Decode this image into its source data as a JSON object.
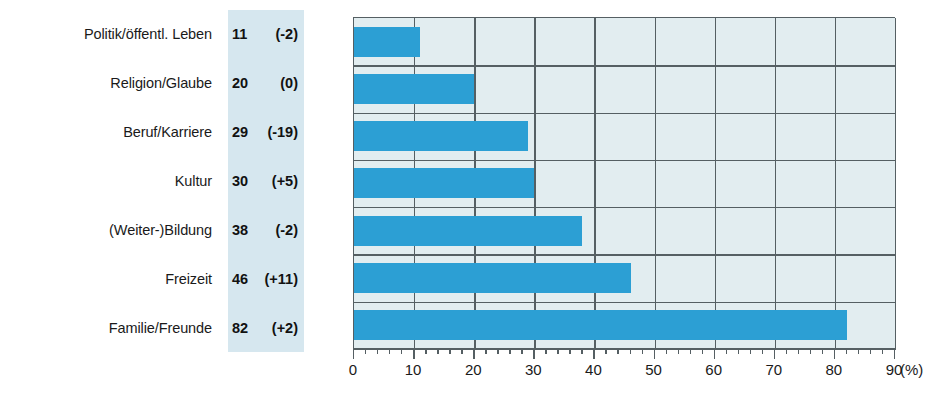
{
  "chart_data": {
    "type": "bar",
    "orientation": "horizontal",
    "title": "",
    "xlabel": "(%)",
    "ylabel": "",
    "xlim": [
      0,
      90
    ],
    "xticks": [
      0,
      10,
      20,
      30,
      40,
      50,
      60,
      70,
      80,
      90
    ],
    "xtick_labels": [
      "0",
      "10",
      "20",
      "30",
      "40",
      "50",
      "60",
      "70",
      "80",
      "90"
    ],
    "minor_tick_step": 2,
    "grid": true,
    "legend": "none",
    "categories": [
      "Politik/öffentl. Leben",
      "Religion/Glaube",
      "Beruf/Karriere",
      "Kultur",
      "(Weiter-)Bildung",
      "Freizeit",
      "Familie/Freunde"
    ],
    "values": [
      11,
      20,
      29,
      30,
      38,
      46,
      82
    ],
    "deltas": [
      "(-2)",
      "(0)",
      "(-19)",
      "(+5)",
      "(-2)",
      "(+11)",
      "(+2)"
    ],
    "delta_values": [
      -2,
      0,
      -19,
      5,
      -2,
      11,
      2
    ],
    "rows": [
      {
        "label": "Politik/öffentl. Leben",
        "value": 11,
        "value_text": "11",
        "delta_text": "(-2)"
      },
      {
        "label": "Religion/Glaube",
        "value": 20,
        "value_text": "20",
        "delta_text": "(0)"
      },
      {
        "label": "Beruf/Karriere",
        "value": 29,
        "value_text": "29",
        "delta_text": "(-19)"
      },
      {
        "label": "Kultur",
        "value": 30,
        "value_text": "30",
        "delta_text": "(+5)"
      },
      {
        "label": "(Weiter-)Bildung",
        "value": 38,
        "value_text": "38",
        "delta_text": "(-2)"
      },
      {
        "label": "Freizeit",
        "value": 46,
        "value_text": "46",
        "delta_text": "(+11)"
      },
      {
        "label": "Familie/Freunde",
        "value": 82,
        "value_text": "82",
        "delta_text": "(+2)"
      }
    ],
    "unit_text": "(%)"
  },
  "colors": {
    "bar": "#2c9fd4",
    "plot_background": "#e2edf0",
    "value_band_background": "#d6e7ef",
    "grid": "#555f63",
    "text": "#1a1a1a",
    "page_background": "#ffffff"
  },
  "footer": {
    "source_note": ""
  }
}
